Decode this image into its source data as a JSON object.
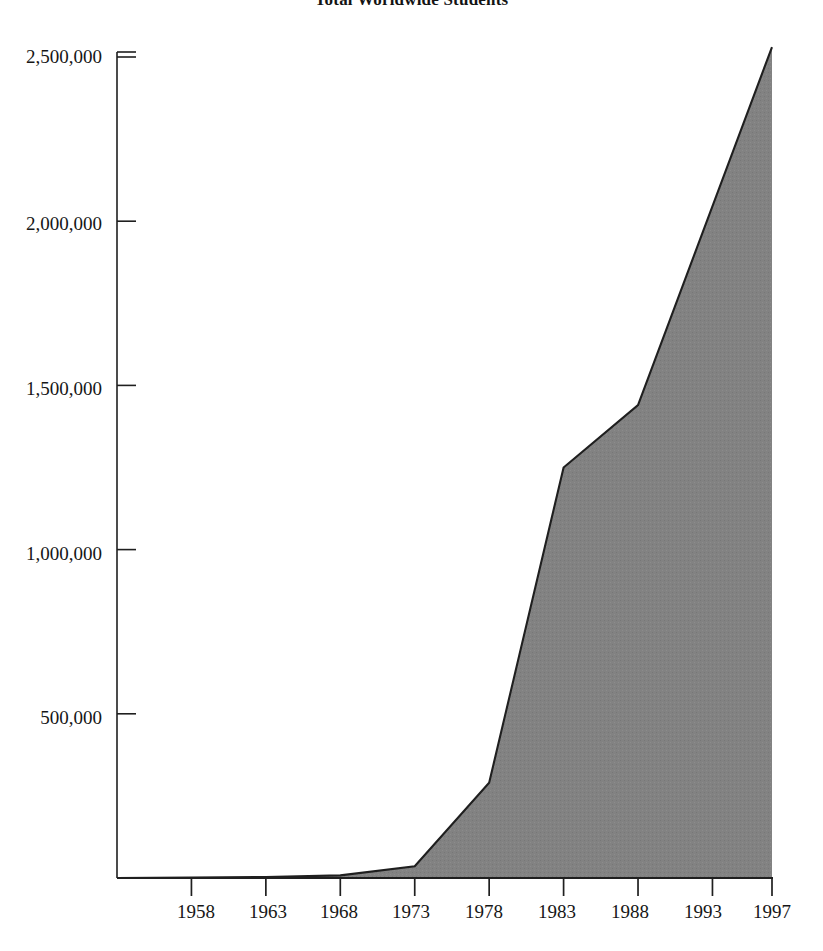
{
  "chart_data": {
    "type": "area",
    "title": "Total Worldwide Students",
    "xlabel": "",
    "ylabel": "",
    "grid": false,
    "legend": "none",
    "fill_color": "#808080",
    "line_color": "#1a1a1a",
    "xlim": [
      1953,
      1997
    ],
    "ylim": [
      0,
      2500000
    ],
    "x_tick_labels": [
      "1958",
      "1963",
      "1968",
      "1973",
      "1978",
      "1983",
      "1988",
      "1993",
      "1997"
    ],
    "x_ticks": [
      1958,
      1963,
      1968,
      1973,
      1978,
      1983,
      1988,
      1993,
      1997
    ],
    "y_tick_labels": [
      "500,000",
      "1,000,000",
      "1,500,000",
      "2,000,000",
      "2,500,000"
    ],
    "y_ticks": [
      500000,
      1000000,
      1500000,
      2000000,
      2500000
    ],
    "x": [
      1953,
      1958,
      1963,
      1968,
      1973,
      1978,
      1983,
      1988,
      1997
    ],
    "values": [
      0,
      1000,
      3000,
      8000,
      36000,
      290000,
      1250000,
      1440000,
      2530000
    ],
    "series": [
      {
        "name": "Total Worldwide Students",
        "values": [
          0,
          1000,
          3000,
          8000,
          36000,
          290000,
          1250000,
          1440000,
          2530000
        ]
      }
    ]
  },
  "axes": {
    "y_axis_name": "y-axis",
    "x_axis_name": "x-axis"
  }
}
